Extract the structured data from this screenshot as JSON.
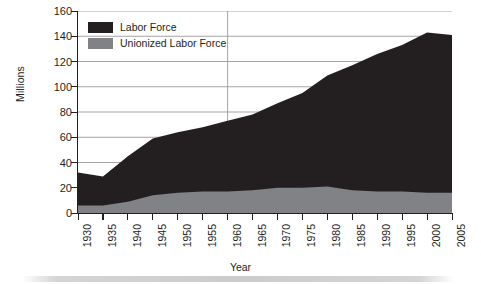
{
  "chart_data": {
    "type": "area",
    "title": "",
    "subtitle": "",
    "xlabel": "Year",
    "ylabel": "Millions",
    "xlim": [
      1930,
      2005
    ],
    "ylim": [
      0,
      160
    ],
    "ytick_step": 20,
    "xtick_step": 5,
    "grid": "horizontal",
    "stacked": true,
    "legend_position": "top-left-inside",
    "x": [
      1930,
      1935,
      1940,
      1945,
      1950,
      1955,
      1960,
      1965,
      1970,
      1975,
      1980,
      1985,
      1990,
      1995,
      2000,
      2005
    ],
    "xticklabels": [
      "1930",
      "1935",
      "1940",
      "1945",
      "1950",
      "1955",
      "1960",
      "1965",
      "1970",
      "1975",
      "1980",
      "1985",
      "1990",
      "1995",
      "2000",
      "2005"
    ],
    "yticklabels": [
      "0",
      "20",
      "40",
      "60",
      "80",
      "100",
      "120",
      "140",
      "160"
    ],
    "ytickvalues": [
      0,
      20,
      40,
      60,
      80,
      100,
      120,
      140,
      160
    ],
    "series": [
      {
        "name": "Labor Force",
        "color": "#231f20",
        "note": "total labor force, top of stack",
        "values": [
          32,
          29,
          45,
          59,
          64,
          68,
          73,
          78,
          87,
          95,
          109,
          117,
          126,
          133,
          143,
          141
        ]
      },
      {
        "name": "Unionized Labor Force",
        "color": "#808285",
        "note": "unionized portion, bottom of stack",
        "values": [
          6,
          6,
          9,
          14,
          16,
          17,
          17,
          18,
          20,
          20,
          21,
          18,
          17,
          17,
          16,
          16
        ]
      }
    ],
    "annotations": []
  },
  "legend": {
    "items": [
      {
        "label": "Labor Force",
        "color": "#231f20"
      },
      {
        "label": "Unionized Labor Force",
        "color": "#808285"
      }
    ]
  },
  "axes": {
    "x_title": "Year",
    "y_title": "Millions"
  },
  "colors": {
    "background": "#ffffff",
    "axis": "#231f20",
    "gridline": "#9b9b9b",
    "labor_force": "#231f20",
    "unionized": "#808285"
  }
}
